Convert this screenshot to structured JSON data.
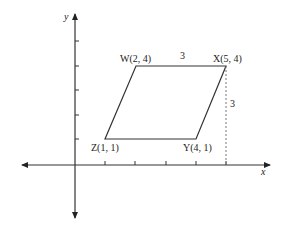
{
  "diagram": {
    "type": "coordinate-plane-parallelogram",
    "axes": {
      "x_label": "x",
      "y_label": "y",
      "x_ticks": [
        1,
        2,
        3,
        4,
        5
      ],
      "y_ticks": [
        1,
        2,
        3,
        4
      ]
    },
    "vertices": [
      {
        "name": "W",
        "coords": "(2, 4)",
        "x": 2,
        "y": 4
      },
      {
        "name": "X",
        "coords": "(5, 4)",
        "x": 5,
        "y": 4
      },
      {
        "name": "Y",
        "coords": "(4, 1)",
        "x": 4,
        "y": 1
      },
      {
        "name": "Z",
        "coords": "(1, 1)",
        "x": 1,
        "y": 1
      }
    ],
    "labels": {
      "W": "W(2, 4)",
      "X": "X(5, 4)",
      "Y": "Y(4, 1)",
      "Z": "Z(1, 1)",
      "top_length": "3",
      "height_length": "3"
    },
    "colors": {
      "line": "#333333",
      "dashed": "#777777",
      "background": "#ffffff"
    }
  }
}
